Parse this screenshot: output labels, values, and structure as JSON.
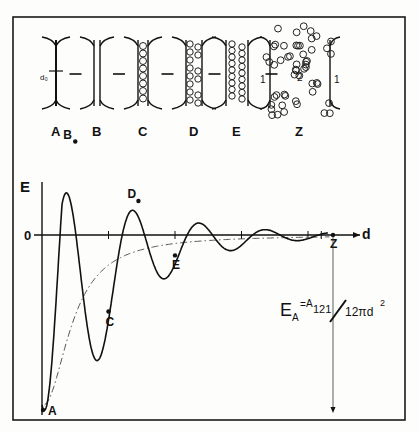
{
  "figure": {
    "stages": [
      {
        "label": "A",
        "description": "two surfaces in contact, separation d0"
      },
      {
        "label": "B",
        "description": "thin film between surfaces"
      },
      {
        "label": "C",
        "description": "single layer of molecules"
      },
      {
        "label": "D",
        "description": "partially filled double layer"
      },
      {
        "label": "E",
        "description": "double layer of molecules"
      },
      {
        "label": "Z",
        "description": "bulk liquid between surfaces"
      }
    ],
    "d0_label": "d₀",
    "z_region_labels": [
      "1",
      "2",
      "1"
    ],
    "arrow_glyph": "→"
  },
  "chart_data": {
    "type": "line",
    "title": "",
    "xlabel": "d",
    "ylabel": "E",
    "origin_label": "0",
    "points": [
      {
        "label": "A",
        "d": 0.0,
        "E": -1.0
      },
      {
        "label": "B",
        "d": 0.5,
        "E": 0.55
      },
      {
        "label": "C",
        "d": 1.0,
        "E": -0.45
      },
      {
        "label": "D",
        "d": 1.45,
        "E": 0.2
      },
      {
        "label": "E",
        "d": 2.0,
        "E": -0.12
      },
      {
        "label": "Z",
        "d": 4.35,
        "E": 0.0
      }
    ],
    "series": [
      {
        "name": "oscillatory solvation energy",
        "style": "solid"
      },
      {
        "name": "continuum van der Waals energy",
        "style": "dash-dot"
      }
    ],
    "formula": {
      "lhs": "E",
      "lhs_sub": "A",
      "eq": "=",
      "num": "A",
      "num_sub": "121",
      "den": "12πd",
      "den_sup": "2"
    },
    "legend": "none"
  }
}
